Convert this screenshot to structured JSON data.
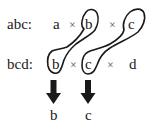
{
  "diagram": {
    "rows": [
      {
        "label": "abc:",
        "terms": [
          "a",
          "b",
          "c"
        ],
        "operator": "×"
      },
      {
        "label": "bcd:",
        "terms": [
          "b",
          "c",
          "d"
        ],
        "operator": "×"
      }
    ],
    "groupings": [
      {
        "connects": [
          "abc.b",
          "bcd.b"
        ]
      },
      {
        "connects": [
          "abc.c",
          "bcd.c"
        ]
      }
    ],
    "arrows": [
      {
        "from": "group-b",
        "direction": "down"
      },
      {
        "from": "group-c",
        "direction": "down"
      }
    ],
    "results": [
      "b",
      "c"
    ],
    "colors": {
      "ink": "#1a1a1a",
      "operator": "#555555",
      "background": "#ffffff"
    }
  }
}
